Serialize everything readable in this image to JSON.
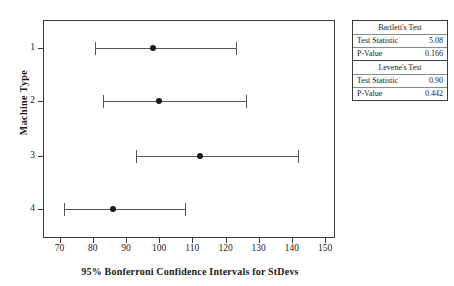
{
  "chart_data": {
    "type": "scatter",
    "title": "",
    "xlabel": "95% Bonferroni Confidence Intervals for StDevs",
    "ylabel": "Machine Type",
    "xlim": [
      65,
      153
    ],
    "xticks": [
      70,
      80,
      90,
      100,
      110,
      120,
      130,
      140,
      150
    ],
    "xtick_labels": [
      "70",
      "80",
      "90",
      "100",
      "110",
      "120",
      "130",
      "140",
      "150"
    ],
    "categories": [
      "1",
      "2",
      "3",
      "4"
    ],
    "grid": false,
    "legend": null,
    "series": [
      {
        "name": "95% Bonferroni CI for StDev",
        "points": [
          {
            "category": "1",
            "center": 97.8,
            "lower": 80.3,
            "upper": 123.0
          },
          {
            "category": "2",
            "center": 99.8,
            "lower": 82.9,
            "upper": 125.9
          },
          {
            "category": "3",
            "center": 112.1,
            "lower": 92.6,
            "upper": 141.6
          },
          {
            "category": "4",
            "center": 85.9,
            "lower": 70.9,
            "upper": 107.5
          }
        ]
      }
    ]
  },
  "axes": {
    "y_title": "Machine Type",
    "x_title": "95% Bonferroni Confidence Intervals for StDevs"
  },
  "stats_table": {
    "blocks": [
      {
        "title": "Bartlett's Test",
        "rows": [
          {
            "label": "Test Statistic",
            "value": "5.08"
          },
          {
            "label": "P-Value",
            "value": "0.166"
          }
        ]
      },
      {
        "title": "Levene's Test",
        "rows": [
          {
            "label": "Test Statistic",
            "value": "0.90"
          },
          {
            "label": "P-Value",
            "value": "0.442"
          }
        ]
      }
    ]
  },
  "colors": {
    "axis": "#3a3a3a",
    "interval": "#555555",
    "point": "#1a1a1a",
    "background": "#ffffff"
  }
}
